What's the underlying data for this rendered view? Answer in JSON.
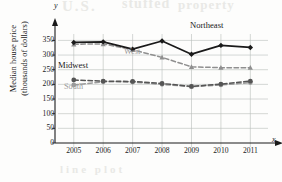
{
  "figure": {
    "background": "#fdfdfc",
    "bleed_artifacts": [
      "U.S.",
      "stuffed",
      "property",
      "line plot"
    ]
  },
  "axis_letters": {
    "y": "y",
    "x": "x"
  },
  "chart_data": {
    "type": "line",
    "title": "",
    "xlabel": "Year",
    "ylabel": "Median house price (thousands of dollars)",
    "ylabel_line1": "Median house price",
    "ylabel_line2": "(thousands of dollars)",
    "categories": [
      "2005",
      "2006",
      "2007",
      "2008",
      "2009",
      "2010",
      "2011"
    ],
    "x": [
      2005,
      2006,
      2007,
      2008,
      2009,
      2010,
      2011
    ],
    "xlim": [
      2004.6,
      2011.6
    ],
    "ylim": [
      0,
      365
    ],
    "yticks": [
      0,
      50,
      100,
      150,
      200,
      250,
      300,
      350
    ],
    "ytick_labels": [
      "0",
      "50",
      "100",
      "150",
      "200",
      "250",
      "300",
      "350"
    ],
    "grid": true,
    "grid_color": "#b9bdbb",
    "legend_position": "inline-annotations",
    "series": [
      {
        "name": "Northeast",
        "values": [
          343,
          345,
          320,
          348,
          303,
          333,
          326
        ],
        "color": "#1a1a1a",
        "style": "solid",
        "marker": "diamond"
      },
      {
        "name": "West",
        "values": [
          337,
          338,
          318,
          292,
          260,
          257,
          257
        ],
        "color": "#8f8f8f",
        "style": "dashed",
        "marker": "triangle"
      },
      {
        "name": "Midwest",
        "values": [
          215,
          211,
          210,
          203,
          193,
          201,
          211
        ],
        "color": "#555555",
        "style": "dashed",
        "marker": "circle"
      },
      {
        "name": "South",
        "values": [
          198,
          209,
          208,
          200,
          192,
          198,
          206
        ],
        "color": "#9a9a9a",
        "style": "dashed",
        "marker": "circle"
      }
    ],
    "annotations": [
      {
        "text": "Northeast",
        "series": "Northeast",
        "color": "#1a1a1a"
      },
      {
        "text": "West",
        "series": "West",
        "color": "#9a9a9a"
      },
      {
        "text": "Midwest",
        "series": "Midwest",
        "color": "#1a1a1a"
      },
      {
        "text": "South",
        "series": "South",
        "color": "#a0a0a0"
      }
    ]
  }
}
